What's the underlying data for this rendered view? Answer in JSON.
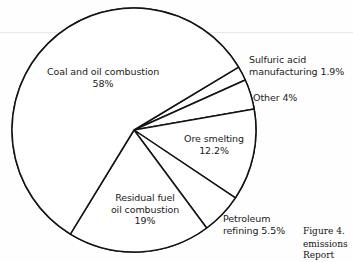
{
  "figure": {
    "caption_number": "Figure 4.",
    "caption_line2": "emissions",
    "caption_line3": "Report"
  },
  "chart_data": {
    "type": "pie",
    "title": "",
    "legend_position": "callout-labels",
    "grid": false,
    "categories": [
      "Coal and oil combustion",
      "Sulfuric acid manufacturing",
      "Other",
      "Ore smelting",
      "Petroleum refining",
      "Residual fuel oil combustion"
    ],
    "values": [
      58,
      1.9,
      4,
      12.2,
      5.5,
      19
    ],
    "value_labels": [
      "58%",
      "1.9%",
      "4%",
      "12.2%",
      "5.5%",
      "19%"
    ],
    "slices": [
      {
        "name": "Coal and oil combustion",
        "label_line1": "Coal and oil combustion",
        "label_line2": "58%",
        "value": 58,
        "value_label": "58%",
        "color": "#ffffff"
      },
      {
        "name": "Sulfuric acid manufacturing",
        "label_line1": "Sulfuric acid",
        "label_line2": "manufacturing 1.9%",
        "value": 1.9,
        "value_label": "1.9%",
        "color": "#ffffff"
      },
      {
        "name": "Other",
        "label_line1": "Other 4%",
        "label_line2": "",
        "value": 4,
        "value_label": "4%",
        "color": "#ffffff"
      },
      {
        "name": "Ore smelting",
        "label_line1": "Ore smelting",
        "label_line2": "12.2%",
        "value": 12.2,
        "value_label": "12.2%",
        "color": "#ffffff"
      },
      {
        "name": "Petroleum refining",
        "label_line1": "Petroleum",
        "label_line2": "refining 5.5%",
        "value": 5.5,
        "value_label": "5.5%",
        "color": "#ffffff"
      },
      {
        "name": "Residual fuel oil combustion",
        "label_line1": "Residual fuel",
        "label_line2": "oil combustion",
        "label_line3": "19%",
        "value": 19,
        "value_label": "19%",
        "color": "#ffffff"
      }
    ],
    "stroke_color": "#131313",
    "background": "#ffffff"
  }
}
